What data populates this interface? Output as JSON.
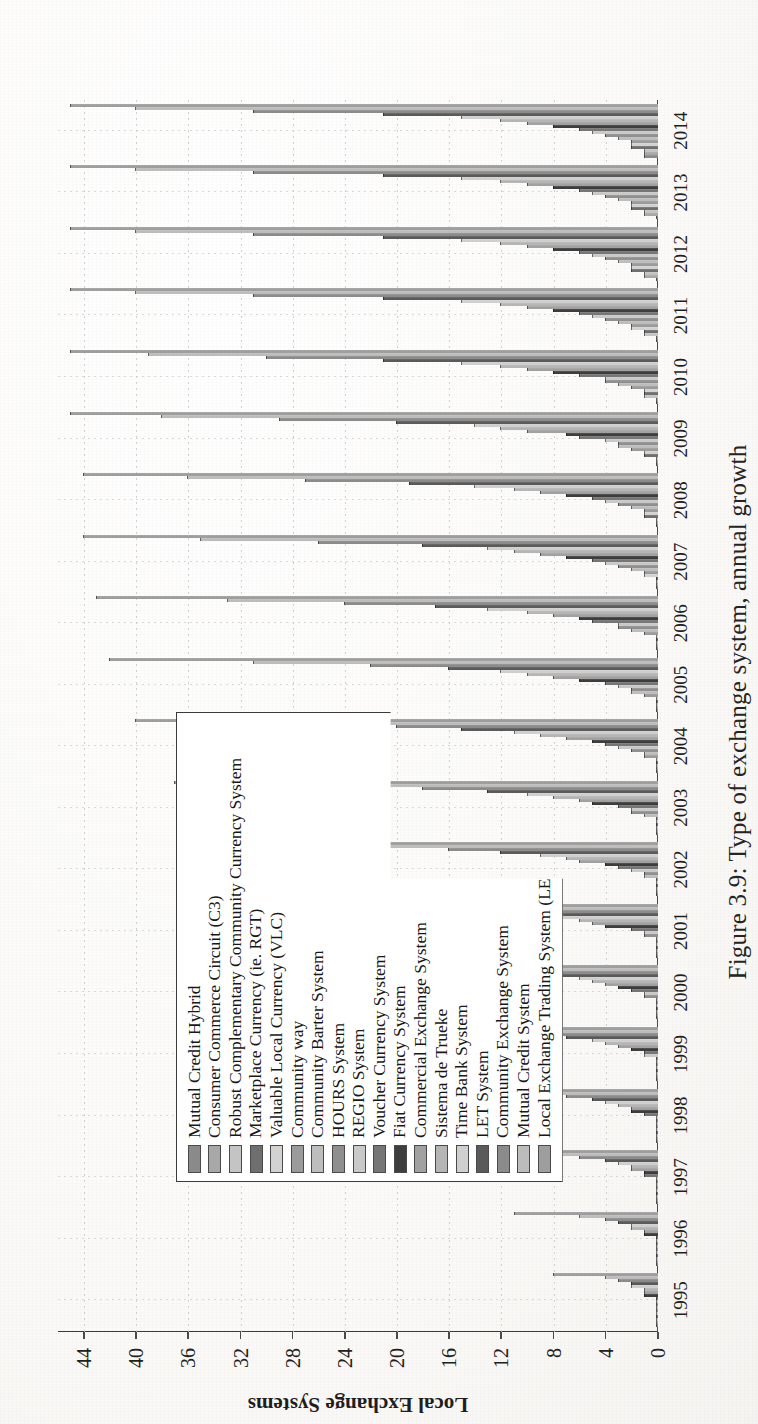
{
  "figure": {
    "caption": "Figure 3.9: Type of exchange system, annual growth"
  },
  "chart_data": {
    "type": "bar",
    "title": "Type of exchange system, annual growth",
    "orientation": "vertical-grouped",
    "xlabel": "",
    "ylabel": "Local Exchange Systems",
    "ylim": [
      0,
      46
    ],
    "yticks": [
      0,
      4,
      8,
      12,
      16,
      20,
      24,
      28,
      32,
      36,
      40,
      44
    ],
    "grid": true,
    "legend_position": "upper-left",
    "categories": [
      "1995",
      "1996",
      "1997",
      "1998",
      "1999",
      "2000",
      "2001",
      "2002",
      "2003",
      "2004",
      "2005",
      "2006",
      "2007",
      "2008",
      "2009",
      "2010",
      "2011",
      "2012",
      "2013",
      "2014"
    ],
    "series": [
      {
        "name": "Mutual Credit Hybrid",
        "color": "#8a8a8a",
        "values": [
          0,
          0,
          0,
          0,
          0,
          0,
          0,
          0,
          0,
          0,
          0,
          0,
          0,
          0,
          0,
          0,
          0,
          0,
          0,
          1
        ]
      },
      {
        "name": "Consumer Commerce Circuit (C3)",
        "color": "#a8a8a8",
        "values": [
          0,
          0,
          0,
          0,
          0,
          0,
          0,
          0,
          0,
          0,
          0,
          0,
          0,
          0,
          0,
          0,
          0,
          1,
          1,
          1
        ]
      },
      {
        "name": "Robust Complementary Community Currency System",
        "color": "#c4c4c4",
        "values": [
          0,
          0,
          0,
          0,
          0,
          0,
          0,
          0,
          0,
          0,
          0,
          0,
          0,
          0,
          0,
          1,
          1,
          1,
          1,
          1
        ]
      },
      {
        "name": "Marketplace Currency (ie. RGT)",
        "color": "#6f6f6f",
        "values": [
          0,
          0,
          0,
          0,
          0,
          0,
          0,
          0,
          0,
          0,
          0,
          0,
          0,
          1,
          1,
          1,
          1,
          2,
          2,
          2
        ]
      },
      {
        "name": "Valuable Local Currency (VLC)",
        "color": "#d2d2d2",
        "values": [
          0,
          0,
          0,
          0,
          0,
          0,
          0,
          0,
          0,
          0,
          0,
          0,
          1,
          1,
          1,
          1,
          2,
          2,
          2,
          2
        ]
      },
      {
        "name": "Community way",
        "color": "#9b9b9b",
        "values": [
          0,
          0,
          0,
          0,
          0,
          0,
          0,
          0,
          0,
          1,
          1,
          1,
          1,
          1,
          2,
          2,
          2,
          2,
          2,
          2
        ]
      },
      {
        "name": "Community Barter System",
        "color": "#bdbdbd",
        "values": [
          0,
          0,
          0,
          0,
          0,
          0,
          0,
          1,
          1,
          1,
          2,
          2,
          2,
          2,
          3,
          3,
          3,
          3,
          3,
          3
        ]
      },
      {
        "name": "HOURS System",
        "color": "#8f8f8f",
        "values": [
          0,
          0,
          0,
          0,
          0,
          1,
          1,
          1,
          2,
          2,
          2,
          3,
          3,
          3,
          3,
          4,
          4,
          4,
          4,
          4
        ]
      },
      {
        "name": "REGIO System",
        "color": "#c9c9c9",
        "values": [
          0,
          0,
          0,
          0,
          1,
          1,
          1,
          2,
          2,
          3,
          3,
          3,
          4,
          4,
          4,
          4,
          5,
          5,
          5,
          5
        ]
      },
      {
        "name": "Voucher Currency System",
        "color": "#767676",
        "values": [
          0,
          0,
          1,
          1,
          1,
          2,
          2,
          3,
          3,
          4,
          4,
          5,
          5,
          5,
          6,
          6,
          6,
          6,
          6,
          6
        ]
      },
      {
        "name": "Fiat Currency System",
        "color": "#3d3d3d",
        "values": [
          1,
          1,
          1,
          2,
          2,
          3,
          4,
          4,
          5,
          5,
          6,
          6,
          7,
          7,
          7,
          8,
          8,
          8,
          8,
          8
        ]
      },
      {
        "name": "Commercial Exchange System",
        "color": "#a1a1a1",
        "values": [
          1,
          1,
          2,
          2,
          3,
          4,
          5,
          6,
          6,
          7,
          8,
          8,
          9,
          9,
          10,
          10,
          10,
          10,
          10,
          10
        ]
      },
      {
        "name": "Sistema de Trueke",
        "color": "#b5b5b5",
        "values": [
          1,
          2,
          2,
          3,
          4,
          5,
          6,
          7,
          8,
          9,
          10,
          10,
          11,
          11,
          12,
          12,
          12,
          12,
          12,
          12
        ]
      },
      {
        "name": "Time Bank System",
        "color": "#cfcfcf",
        "values": [
          2,
          2,
          3,
          4,
          5,
          6,
          8,
          9,
          10,
          11,
          12,
          13,
          13,
          14,
          14,
          15,
          15,
          15,
          15,
          15
        ]
      },
      {
        "name": "LET System",
        "color": "#5a5a5a",
        "values": [
          2,
          3,
          4,
          5,
          7,
          8,
          10,
          12,
          13,
          15,
          16,
          17,
          18,
          19,
          20,
          21,
          21,
          21,
          21,
          21
        ]
      },
      {
        "name": "Community Exchange System",
        "color": "#8b8b8b",
        "values": [
          3,
          4,
          6,
          7,
          9,
          12,
          14,
          16,
          18,
          20,
          22,
          24,
          26,
          27,
          29,
          30,
          31,
          31,
          31,
          31
        ]
      },
      {
        "name": "Mutual Credit System",
        "color": "#bcbcbc",
        "values": [
          4,
          6,
          8,
          10,
          13,
          16,
          19,
          22,
          25,
          28,
          31,
          33,
          35,
          36,
          38,
          39,
          40,
          40,
          40,
          40
        ]
      },
      {
        "name": "Local Exchange Trading System (LETS)",
        "color": "#9e9e9e",
        "values": [
          8,
          11,
          14,
          17,
          21,
          26,
          30,
          34,
          37,
          40,
          42,
          43,
          44,
          44,
          45,
          45,
          45,
          45,
          45,
          45
        ]
      }
    ]
  }
}
